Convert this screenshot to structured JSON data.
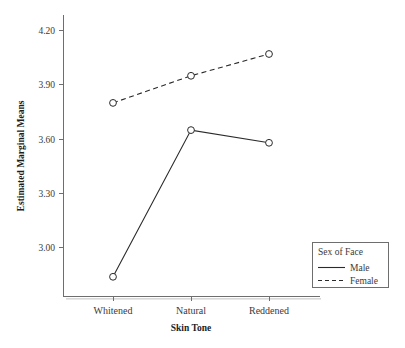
{
  "chart_data": {
    "type": "line",
    "title": "",
    "subtitle": "",
    "xlabel": "Skin Tone",
    "ylabel": "Estimated Marginal Means",
    "categories": [
      "Whitened",
      "Natural",
      "Reddened"
    ],
    "series": [
      {
        "name": "Male",
        "style": "solid",
        "marker": "open-circle",
        "values": [
          2.84,
          3.65,
          3.58
        ]
      },
      {
        "name": "Female",
        "style": "dashed",
        "marker": "open-circle",
        "values": [
          3.8,
          3.95,
          4.07
        ]
      }
    ],
    "ylim": [
      2.78,
      4.28
    ],
    "yticks": [
      "3.00",
      "3.30",
      "3.60",
      "3.90",
      "4.20"
    ],
    "ytick_values": [
      3.0,
      3.3,
      3.6,
      3.9,
      4.2
    ],
    "grid": false,
    "legend": {
      "title": "Sex of Face",
      "position": "bottom-right",
      "entries": [
        {
          "label": "Male",
          "style": "solid"
        },
        {
          "label": "Female",
          "style": "dashed"
        }
      ]
    },
    "colors": {
      "line": "#2a2a2a",
      "axis": "#6e6e6e",
      "text": "#3a3a3a",
      "background": "#ffffff"
    }
  },
  "axis": {
    "y_title": "Estimated Marginal Means",
    "x_title": "Skin Tone",
    "y_tick_labels": [
      "4.20",
      "3.90",
      "3.60",
      "3.30",
      "3.00"
    ],
    "x_tick_labels": [
      "Whitened",
      "Natural",
      "Reddened"
    ]
  },
  "legend": {
    "title": "Sex of Face",
    "male_label": "Male",
    "female_label": "Female"
  }
}
